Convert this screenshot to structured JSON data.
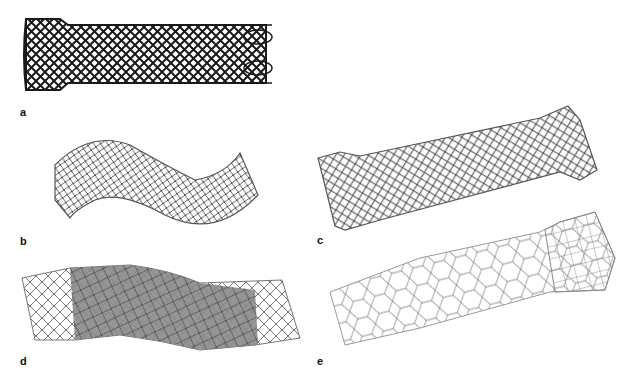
{
  "figure": {
    "panels": [
      {
        "id": "a",
        "label": "a",
        "description": "straight braided stent with flared left end and looped right end"
      },
      {
        "id": "b",
        "label": "b",
        "description": "curved S-shaped braided stent"
      },
      {
        "id": "c",
        "label": "c",
        "description": "dumbbell-shaped braided stent with flared ends"
      },
      {
        "id": "d",
        "label": "d",
        "description": "covered stent with uncovered flared mesh ends"
      },
      {
        "id": "e",
        "label": "e",
        "description": "laser-cut cell stent with flared mesh end"
      }
    ],
    "colors": {
      "background": "#ffffff",
      "mesh_dark": "#1a1a1a",
      "mesh_gray": "#555555",
      "cover_gray": "#8a8a8a",
      "mesh_light": "#9a9a9a"
    }
  }
}
